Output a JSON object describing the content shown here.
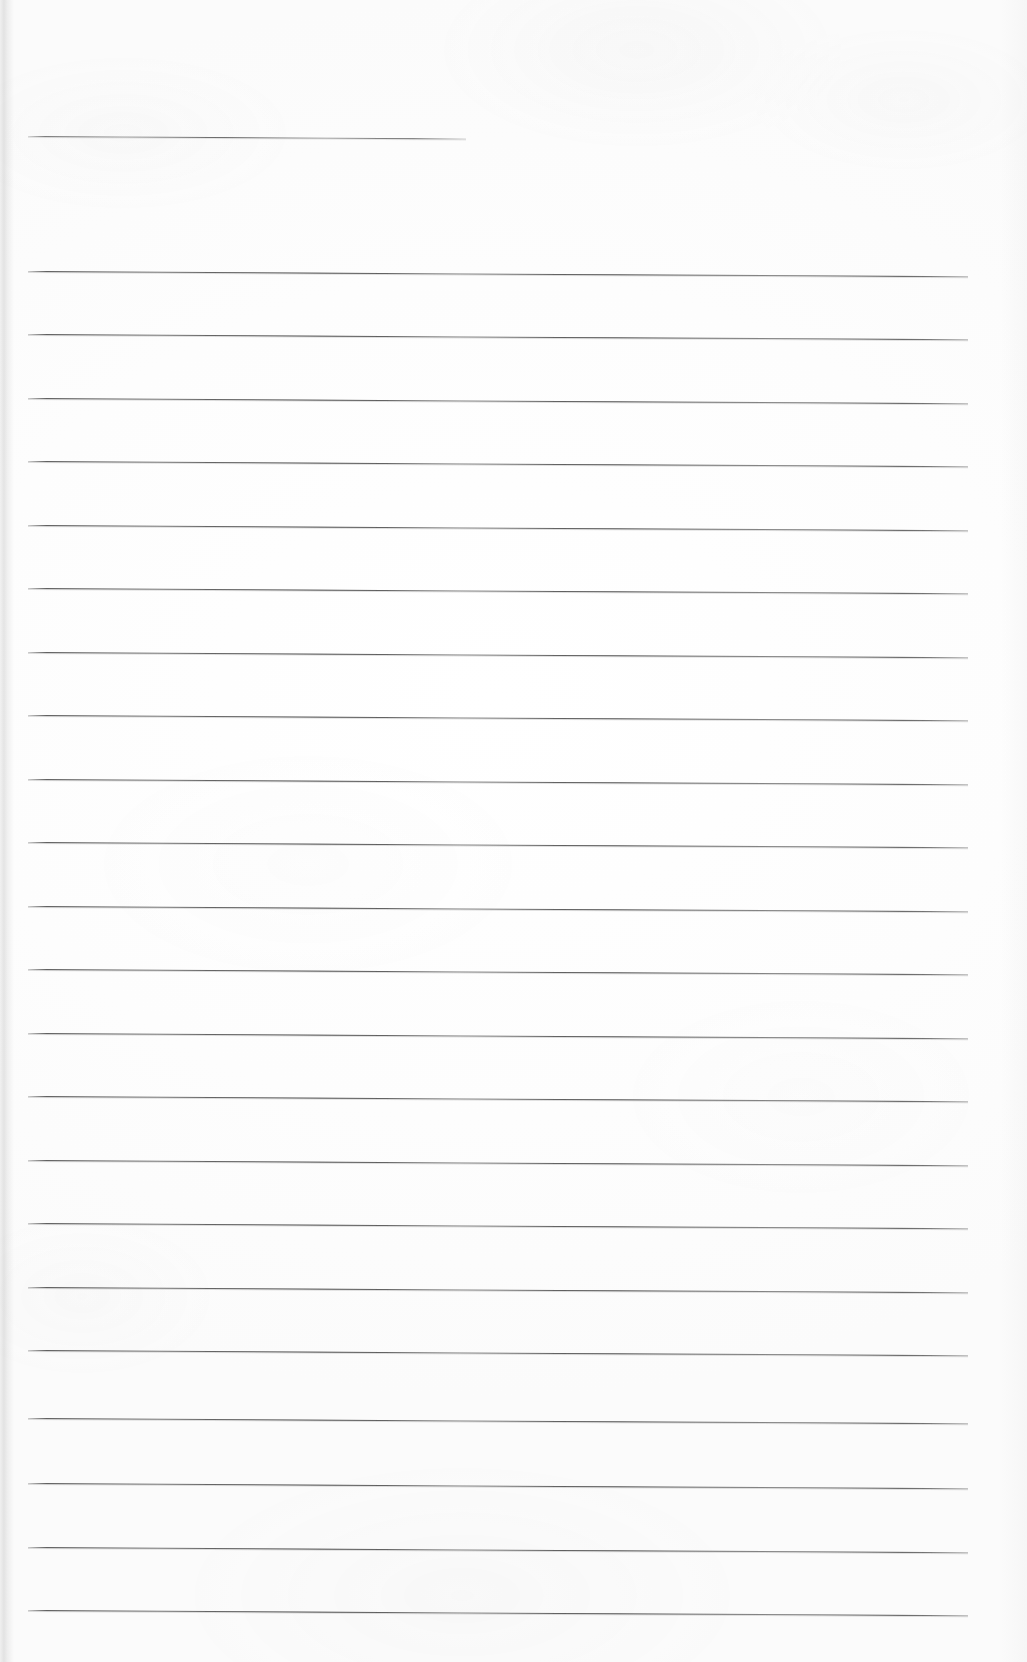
{
  "document": {
    "type": "scanned-lined-paper",
    "title": "Blank ruled writing paper",
    "page_width": 1027,
    "page_height": 1662,
    "background_color": "#fdfdfd",
    "rule_color": "#4a4a4a",
    "content_text": "",
    "is_blank": true
  },
  "layout": {
    "rule_left_x": 28,
    "rule_right_x": 968,
    "header_rule_right_x": 466,
    "first_rule_y": 271,
    "rule_spacing": 63.5,
    "rule_count": 22,
    "skew_degrees": 0.32
  },
  "rules": [
    {
      "name": "header-rule",
      "y": 136,
      "x1": 28,
      "x2": 466,
      "full_width": false
    },
    {
      "name": "rule-1",
      "y": 271,
      "x1": 28,
      "x2": 968,
      "full_width": true
    },
    {
      "name": "rule-2",
      "y": 334,
      "x1": 28,
      "x2": 968,
      "full_width": true
    },
    {
      "name": "rule-3",
      "y": 398,
      "x1": 28,
      "x2": 968,
      "full_width": true
    },
    {
      "name": "rule-4",
      "y": 461,
      "x1": 28,
      "x2": 968,
      "full_width": true
    },
    {
      "name": "rule-5",
      "y": 525,
      "x1": 28,
      "x2": 968,
      "full_width": true
    },
    {
      "name": "rule-6",
      "y": 588,
      "x1": 28,
      "x2": 968,
      "full_width": true
    },
    {
      "name": "rule-7",
      "y": 652,
      "x1": 28,
      "x2": 968,
      "full_width": true
    },
    {
      "name": "rule-8",
      "y": 715,
      "x1": 28,
      "x2": 968,
      "full_width": true
    },
    {
      "name": "rule-9",
      "y": 779,
      "x1": 28,
      "x2": 968,
      "full_width": true
    },
    {
      "name": "rule-10",
      "y": 842,
      "x1": 28,
      "x2": 968,
      "full_width": true
    },
    {
      "name": "rule-11",
      "y": 906,
      "x1": 28,
      "x2": 968,
      "full_width": true
    },
    {
      "name": "rule-12",
      "y": 969,
      "x1": 28,
      "x2": 968,
      "full_width": true
    },
    {
      "name": "rule-13",
      "y": 1033,
      "x1": 28,
      "x2": 968,
      "full_width": true
    },
    {
      "name": "rule-14",
      "y": 1096,
      "x1": 28,
      "x2": 968,
      "full_width": true
    },
    {
      "name": "rule-15",
      "y": 1160,
      "x1": 28,
      "x2": 968,
      "full_width": true
    },
    {
      "name": "rule-16",
      "y": 1223,
      "x1": 28,
      "x2": 968,
      "full_width": true
    },
    {
      "name": "rule-17",
      "y": 1287,
      "x1": 28,
      "x2": 968,
      "full_width": true
    },
    {
      "name": "rule-18",
      "y": 1350,
      "x1": 28,
      "x2": 968,
      "full_width": true
    },
    {
      "name": "rule-19",
      "y": 1418,
      "x1": 28,
      "x2": 968,
      "full_width": true
    },
    {
      "name": "rule-20",
      "y": 1483,
      "x1": 28,
      "x2": 968,
      "full_width": true
    },
    {
      "name": "rule-21",
      "y": 1547,
      "x1": 28,
      "x2": 968,
      "full_width": true
    },
    {
      "name": "rule-22",
      "y": 1610,
      "x1": 28,
      "x2": 968,
      "full_width": true
    }
  ]
}
